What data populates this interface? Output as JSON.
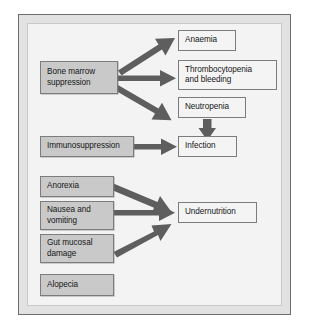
{
  "diagram": {
    "type": "flowchart",
    "title": "",
    "colors": {
      "cause_box_fill": "#c9c9c9",
      "effect_box_fill": "#f4f4f4",
      "box_border": "#7c7c7c",
      "arrow": "#5e5e5e",
      "frame_border": "#6e6e6e",
      "frame_band": "#e2e2e2",
      "background": "#f3f3f3"
    },
    "causes": [
      {
        "id": "bone-marrow-suppression",
        "label": "Bone marrow\nsuppression"
      },
      {
        "id": "immunosuppression",
        "label": "Immunosuppression"
      },
      {
        "id": "anorexia",
        "label": "Anorexia"
      },
      {
        "id": "nausea-and-vomiting",
        "label": "Nausea and\nvomiting"
      },
      {
        "id": "gut-mucosal-damage",
        "label": "Gut mucosal\ndamage"
      },
      {
        "id": "alopecia",
        "label": "Alopecia"
      }
    ],
    "effects": [
      {
        "id": "anaemia",
        "label": "Anaemia"
      },
      {
        "id": "thrombocytopenia-and-bleeding",
        "label": "Thrombocytopenia\nand bleeding"
      },
      {
        "id": "neutropenia",
        "label": "Neutropenia"
      },
      {
        "id": "infection",
        "label": "Infection"
      },
      {
        "id": "undernutrition",
        "label": "Undernutrition"
      }
    ],
    "edges": [
      {
        "from": "bone-marrow-suppression",
        "to": "anaemia"
      },
      {
        "from": "bone-marrow-suppression",
        "to": "thrombocytopenia-and-bleeding"
      },
      {
        "from": "bone-marrow-suppression",
        "to": "neutropenia"
      },
      {
        "from": "neutropenia",
        "to": "infection"
      },
      {
        "from": "immunosuppression",
        "to": "infection"
      },
      {
        "from": "anorexia",
        "to": "undernutrition"
      },
      {
        "from": "nausea-and-vomiting",
        "to": "undernutrition"
      },
      {
        "from": "gut-mucosal-damage",
        "to": "undernutrition"
      }
    ]
  }
}
